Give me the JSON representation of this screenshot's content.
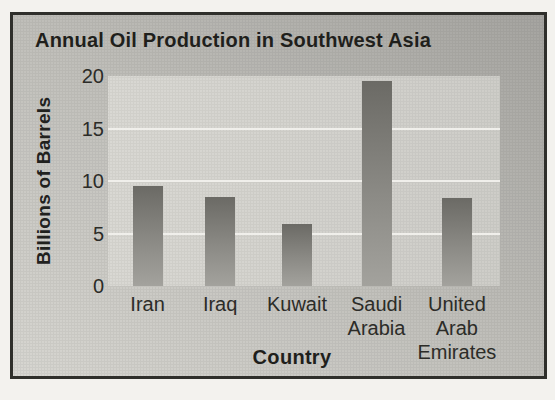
{
  "chart_data": {
    "type": "bar",
    "title": "Annual Oil Production in Southwest Asia",
    "xlabel": "Country",
    "ylabel": "Billions of Barrels",
    "categories": [
      "Iran",
      "Iraq",
      "Kuwait",
      "Saudi Arabia",
      "United Arab Emirates"
    ],
    "category_lines": [
      [
        "Iran"
      ],
      [
        "Iraq"
      ],
      [
        "Kuwait"
      ],
      [
        "Saudi",
        "Arabia"
      ],
      [
        "United",
        "Arab",
        "Emirates"
      ]
    ],
    "values": [
      9.5,
      8.5,
      5.9,
      19.5,
      8.4
    ],
    "ylim": [
      0,
      20
    ],
    "yticks": [
      0,
      5,
      10,
      15,
      20
    ],
    "gridline_values": [
      5,
      10,
      15
    ],
    "grid": true,
    "legend": false,
    "bar_centers_frac": [
      0.101,
      0.286,
      0.482,
      0.685,
      0.89
    ],
    "colors": {
      "page_background": "#f3f2ee",
      "card_background_light": "#d7d6d1",
      "card_background_dark": "#a5a4a0",
      "plot_background": "#d3d2cd",
      "gridline": "#f0efeb",
      "bar_top": "#6b6a65",
      "bar_bottom": "#a3a29d",
      "border": "#2f2f2b",
      "text": "#21211e"
    }
  }
}
